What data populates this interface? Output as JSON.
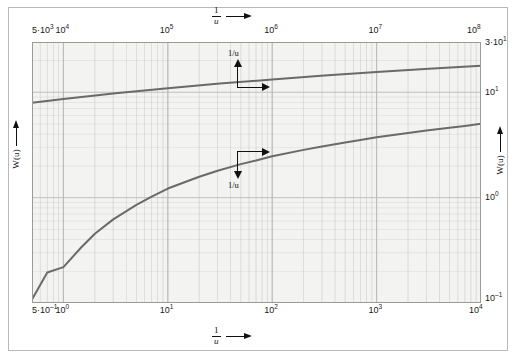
{
  "figure": {
    "background_color": "#ffffff",
    "plot_background_color": "#f3f3f1",
    "curve_color": "#6a6a6a",
    "grid_color": "#b9b9b9",
    "border_color": "#9a9a9a"
  },
  "axes": {
    "top": {
      "label_numerator": "1",
      "label_denominator": "u",
      "arrow": "arrow-right-icon",
      "ticks": [
        {
          "mantissa": "5·10",
          "exp": "3",
          "text": "5·10³"
        },
        {
          "mantissa": "10",
          "exp": "4",
          "text": "10⁴"
        },
        {
          "mantissa": "10",
          "exp": "5",
          "text": "10⁵"
        },
        {
          "mantissa": "10",
          "exp": "6",
          "text": "10⁶"
        },
        {
          "mantissa": "10",
          "exp": "7",
          "text": "10⁷"
        },
        {
          "mantissa": "10",
          "exp": "8",
          "text": "10⁸"
        }
      ]
    },
    "bottom": {
      "label_numerator": "1",
      "label_denominator": "u",
      "arrow": "arrow-right-icon",
      "ticks": [
        {
          "mantissa": "5·10",
          "exp": "–1",
          "text": "5·10⁻¹"
        },
        {
          "mantissa": "10",
          "exp": "0",
          "text": "10⁰"
        },
        {
          "mantissa": "10",
          "exp": "1",
          "text": "10¹"
        },
        {
          "mantissa": "10",
          "exp": "2",
          "text": "10²"
        },
        {
          "mantissa": "10",
          "exp": "3",
          "text": "10³"
        },
        {
          "mantissa": "10",
          "exp": "4",
          "text": "10⁴"
        }
      ]
    },
    "left": {
      "label": "W(u)",
      "arrow": "arrow-up-icon"
    },
    "right": {
      "label": "W(u)",
      "arrow": "arrow-up-icon",
      "ticks": [
        {
          "mantissa": "3·10",
          "exp": "1",
          "text": "3·10¹"
        },
        {
          "mantissa": "10",
          "exp": "1",
          "text": "10¹"
        },
        {
          "mantissa": "10",
          "exp": "0",
          "text": "10⁰"
        },
        {
          "mantissa": "10",
          "exp": "–1",
          "text": "10⁻¹"
        }
      ]
    }
  },
  "annotations": [
    {
      "id": "match-point-upper",
      "label_text": "1/u",
      "label_position": "above",
      "arrows": [
        "up",
        "right"
      ]
    },
    {
      "id": "match-point-lower",
      "label_text": "1/u",
      "label_position": "below",
      "arrows": [
        "down",
        "right"
      ]
    }
  ],
  "chart_data": {
    "type": "line",
    "xlabel": "1/u",
    "ylabel": "W(u)",
    "xscale": "log",
    "yscale": "log",
    "grid": true,
    "legend": "none",
    "bottom_axis": {
      "label": "1/u",
      "xlim": [
        0.5,
        10000
      ],
      "ticks": [
        0.5,
        1,
        10,
        100,
        1000,
        10000
      ]
    },
    "top_axis": {
      "label": "1/u",
      "xlim": [
        5000,
        100000000
      ],
      "ticks": [
        5000,
        10000,
        100000,
        1000000,
        10000000,
        100000000
      ]
    },
    "right_axis": {
      "label": "W(u)",
      "ylim": [
        0.1,
        30
      ],
      "ticks": [
        0.1,
        1,
        10,
        30
      ]
    },
    "series": [
      {
        "name": "W(u) upper curve (top/right axes)",
        "x_axis": "top",
        "x": [
          5000,
          10000,
          31600,
          100000,
          316000,
          1000000,
          3160000,
          10000000,
          31600000,
          100000000
        ],
        "y": [
          7.94,
          8.63,
          9.77,
          10.94,
          12.09,
          13.24,
          14.39,
          15.54,
          16.69,
          17.84
        ]
      },
      {
        "name": "W(u) lower curve (bottom/right axes)",
        "x_axis": "bottom",
        "x": [
          0.5,
          0.7,
          1.0,
          1.5,
          2.0,
          3.0,
          5.0,
          7.0,
          10,
          20,
          30,
          50,
          70,
          100,
          200,
          300,
          500,
          700,
          1000,
          2000,
          3000,
          5000,
          7000,
          10000
        ],
        "y": [
          0.108,
          0.195,
          0.219,
          0.342,
          0.454,
          0.622,
          0.852,
          1.02,
          1.22,
          1.58,
          1.8,
          2.08,
          2.25,
          2.47,
          2.84,
          3.06,
          3.34,
          3.52,
          3.75,
          4.11,
          4.33,
          4.61,
          4.79,
          5.02
        ]
      }
    ]
  }
}
